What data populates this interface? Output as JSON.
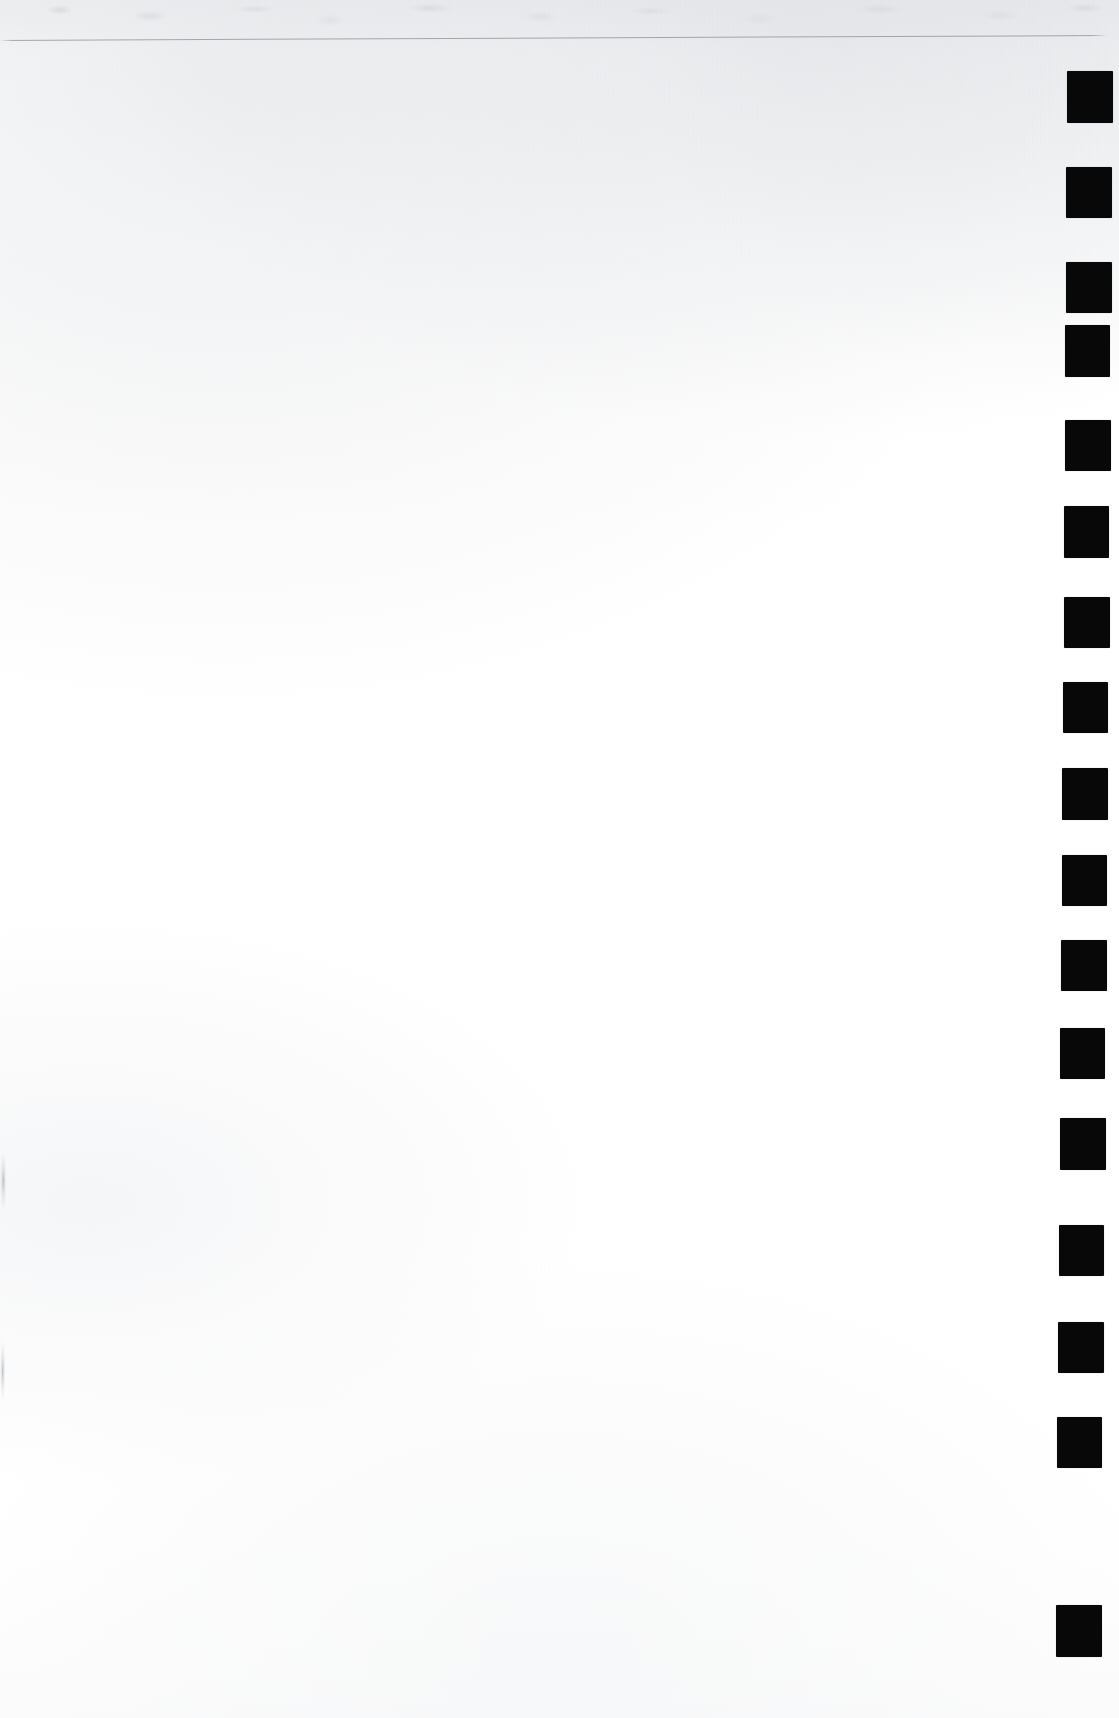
{
  "document": {
    "kind": "scanned-page",
    "title": "Scanned blank page with right-edge index tabs",
    "page_background_color": "#ffffff",
    "ink_color": "#080808",
    "rule_color": "#96999e",
    "width_px": 1119,
    "height_px": 1718,
    "body_text": "",
    "note": "Page body is blank; no printed text is present."
  },
  "header_rule": {
    "name": "horizontal-rule",
    "x_start_px": 0,
    "x_end_px": 1108,
    "y_left_px": 40,
    "y_right_px": 35,
    "thickness_px": 1,
    "color": "#96999e"
  },
  "index_tabs": {
    "label": "index-tab-column",
    "count": 17,
    "color": "#080808",
    "width_px": 46,
    "height_px": 52,
    "pitch_px": 95.9,
    "first_top_px": 71,
    "last_top_px": 1605,
    "items": [
      {
        "index": 1,
        "left": 1067,
        "top": 71,
        "width": 46,
        "height": 52
      },
      {
        "index": 2,
        "left": 1066,
        "top": 167,
        "width": 46,
        "height": 51
      },
      {
        "index": 3,
        "left": 1066,
        "top": 262,
        "width": 46,
        "height": 51
      },
      {
        "index": 4,
        "left": 1065,
        "top": 325,
        "width": 45,
        "height": 52
      },
      {
        "index": 5,
        "left": 1065,
        "top": 420,
        "width": 46,
        "height": 51
      },
      {
        "index": 6,
        "left": 1064,
        "top": 506,
        "width": 45,
        "height": 52
      },
      {
        "index": 7,
        "left": 1064,
        "top": 597,
        "width": 46,
        "height": 51
      },
      {
        "index": 8,
        "left": 1063,
        "top": 682,
        "width": 45,
        "height": 51
      },
      {
        "index": 9,
        "left": 1062,
        "top": 768,
        "width": 46,
        "height": 52
      },
      {
        "index": 10,
        "left": 1062,
        "top": 855,
        "width": 45,
        "height": 51
      },
      {
        "index": 11,
        "left": 1061,
        "top": 940,
        "width": 46,
        "height": 51
      },
      {
        "index": 12,
        "left": 1060,
        "top": 1028,
        "width": 45,
        "height": 51
      },
      {
        "index": 13,
        "left": 1060,
        "top": 1118,
        "width": 46,
        "height": 52
      },
      {
        "index": 14,
        "left": 1059,
        "top": 1225,
        "width": 45,
        "height": 51
      },
      {
        "index": 15,
        "left": 1058,
        "top": 1322,
        "width": 46,
        "height": 51
      },
      {
        "index": 16,
        "left": 1057,
        "top": 1417,
        "width": 45,
        "height": 51
      },
      {
        "index": 17,
        "left": 1056,
        "top": 1605,
        "width": 46,
        "height": 52
      }
    ]
  },
  "edge_marks": {
    "label": "left-edge-scan-smudges",
    "color": "#96999e",
    "items": [
      {
        "index": 1,
        "left": 0,
        "top": 1152,
        "width": 11,
        "height": 58
      },
      {
        "index": 2,
        "left": 0,
        "top": 1340,
        "width": 9,
        "height": 62
      }
    ]
  }
}
